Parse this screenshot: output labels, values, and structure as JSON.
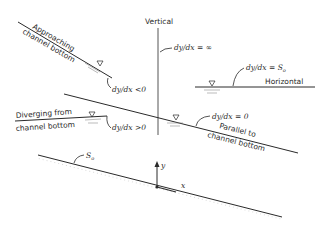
{
  "diagram": {
    "labels": {
      "vertical": "Vertical",
      "dy_inf": "dy/dx = ∞",
      "dy_so": "dy/dx = S",
      "dy_so_sub": "o",
      "horizontal": "Horizontal",
      "approaching_1": "Approaching",
      "approaching_2": "channel bottom",
      "dy_neg": "dy/dx <0",
      "diverging_1": "Diverging from",
      "diverging_2": "channel bottom",
      "dy_pos": "dy/dx >0",
      "dy_zero": "dy/dx = 0",
      "parallel_1": "Parallel to",
      "parallel_2": "channel bottom",
      "so": "S",
      "so_sub": "o",
      "axis_y": "y",
      "axis_x": "x"
    },
    "colors": {
      "ink": "#2a2a2a",
      "background": "#ffffff"
    }
  }
}
